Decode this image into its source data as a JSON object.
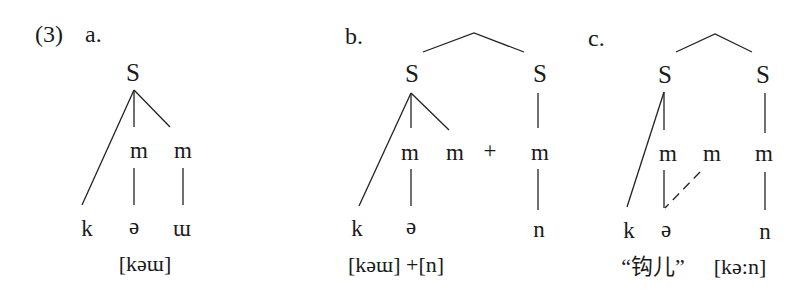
{
  "example_number": "(3)",
  "panels": [
    {
      "id": "a",
      "label": "a.",
      "syllables": [
        {
          "node": "S",
          "moras": [
            "m",
            "m"
          ],
          "onset": "k",
          "segments": [
            "k",
            "ə",
            "ɯ"
          ]
        }
      ],
      "transcription": "[kəɯ]"
    },
    {
      "id": "b",
      "label": "b.",
      "syllables": [
        {
          "node": "S",
          "moras": [
            "m",
            "m"
          ],
          "onset": "k",
          "segments": [
            "k",
            "ə"
          ]
        },
        {
          "node": "S",
          "moras": [
            "m"
          ],
          "segments": [
            "n"
          ]
        }
      ],
      "plus": "+",
      "transcription": "[kəɯ] +[n]"
    },
    {
      "id": "c",
      "label": "c.",
      "syllables": [
        {
          "node": "S",
          "moras": [
            "m",
            "m"
          ],
          "onset": "k",
          "segments": [
            "k",
            "ə"
          ],
          "note": "second mora linked to ə by dashed line"
        },
        {
          "node": "S",
          "moras": [
            "m"
          ],
          "segments": [
            "n"
          ]
        }
      ],
      "gloss": "“钩儿”",
      "transcription": "[kə:n]"
    }
  ]
}
